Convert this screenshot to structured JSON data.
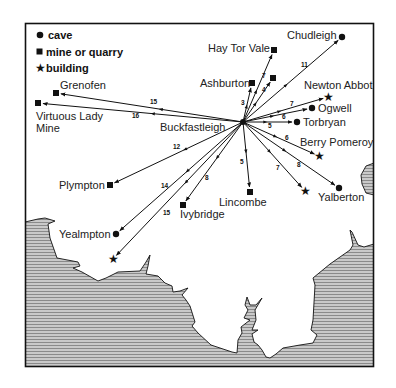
{
  "legend": {
    "items": [
      {
        "symbol": "cave",
        "label": "cave"
      },
      {
        "symbol": "mine",
        "label": "mine or quarry"
      },
      {
        "symbol": "building",
        "label": "building"
      }
    ]
  },
  "hub": {
    "name": "Buckfastleigh",
    "x": 243,
    "y": 122,
    "label_x": 160,
    "label_y": 131
  },
  "sites": [
    {
      "name": "Chudleigh",
      "type": "cave",
      "distance": "11",
      "x": 342,
      "y": 37,
      "lx": 287,
      "ly": 39,
      "nx": 301,
      "ny": 67
    },
    {
      "name": "Hay Tor Vale",
      "type": "mine",
      "distance": "7",
      "x": 274,
      "y": 50,
      "lx": 208,
      "ly": 52,
      "nx": 262,
      "ny": 78
    },
    {
      "name": "",
      "type": "mine",
      "distance": "4",
      "x": 273,
      "y": 78,
      "lx": 0,
      "ly": 0,
      "nx": 262,
      "ny": 92
    },
    {
      "name": "Ashburton",
      "type": "mine",
      "distance": "3",
      "x": 252,
      "y": 83,
      "lx": 200,
      "ly": 87,
      "nx": 241,
      "ny": 105
    },
    {
      "name": "Newton Abbot",
      "type": "building",
      "distance": "7",
      "x": 328,
      "y": 97,
      "lx": 304,
      "ly": 89,
      "nx": 290,
      "ny": 106
    },
    {
      "name": "Ogwell",
      "type": "cave",
      "distance": "7",
      "x": 312,
      "y": 108,
      "lx": 318,
      "ly": 112,
      "nx": 0,
      "ny": 0
    },
    {
      "name": "Torbryan",
      "type": "cave",
      "distance": "6",
      "x": 297,
      "y": 122,
      "lx": 303,
      "ly": 126,
      "nx": 282,
      "ny": 119
    },
    {
      "name": "",
      "type": "",
      "distance": "5",
      "x": 0,
      "y": 0,
      "lx": 0,
      "ly": 0,
      "nx": 268,
      "ny": 128
    },
    {
      "name": "Berry Pomeroy",
      "type": "building",
      "distance": "6",
      "x": 319,
      "y": 156,
      "lx": 300,
      "ly": 146,
      "nx": 285,
      "ny": 140
    },
    {
      "name": "Yalberton",
      "type": "cave",
      "distance": "8",
      "x": 339,
      "y": 188,
      "lx": 318,
      "ly": 201,
      "nx": 297,
      "ny": 167
    },
    {
      "name": "",
      "type": "building",
      "distance": "7",
      "x": 305,
      "y": 191,
      "lx": 0,
      "ly": 0,
      "nx": 276,
      "ny": 170
    },
    {
      "name": "Lincombe",
      "type": "mine",
      "distance": "5",
      "x": 250,
      "y": 192,
      "lx": 219,
      "ly": 206,
      "nx": 240,
      "ny": 164
    },
    {
      "name": "Ivybridge",
      "type": "mine",
      "distance": "8",
      "x": 183,
      "y": 205,
      "lx": 180,
      "ly": 218,
      "nx": 205,
      "ny": 180
    },
    {
      "name": "Plympton",
      "type": "mine",
      "distance": "12",
      "x": 110,
      "y": 185,
      "lx": 59,
      "ly": 189,
      "nx": 173,
      "ny": 149
    },
    {
      "name": "Yealmpton",
      "type": "cave",
      "distance": "14",
      "x": 116,
      "y": 234,
      "lx": 59,
      "ly": 238,
      "nx": 161,
      "ny": 188
    },
    {
      "name": "",
      "type": "building",
      "distance": "15",
      "x": 113,
      "y": 259,
      "lx": 0,
      "ly": 0,
      "nx": 163,
      "ny": 215
    },
    {
      "name": "Grenofen",
      "type": "mine",
      "distance": "15",
      "x": 56,
      "y": 93,
      "lx": 60,
      "ly": 89,
      "nx": 150,
      "ny": 104
    },
    {
      "name": "Virtuous Lady",
      "type": "mine",
      "distance": "16",
      "x": 38,
      "y": 103,
      "lx": 36,
      "ly": 120,
      "nx": 132,
      "ny": 118,
      "line2": "Mine"
    }
  ],
  "colors": {
    "ink": "#111111",
    "sea_fill": "#b5b5b5",
    "sea_line": "#8a8a8a",
    "frame": "#1a1a1a",
    "background": "#ffffff"
  }
}
